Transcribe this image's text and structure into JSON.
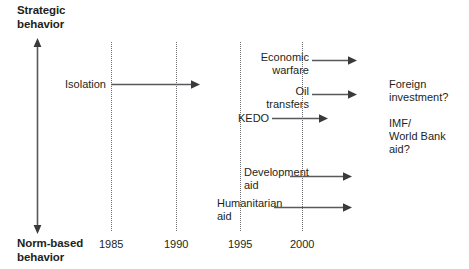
{
  "diagram": {
    "type": "timeline-axes",
    "y_axis": {
      "top_label": "Strategic\nbehavior",
      "bottom_label": "Norm-based\nbehavior",
      "arrow_style": "double-headed",
      "orientation": "vertical"
    },
    "x_axis": {
      "tick_labels": [
        "1985",
        "1990",
        "1995",
        "2000"
      ],
      "gridlines": "dotted-vertical"
    },
    "flows": [
      {
        "label": "Isolation",
        "label_align": "right",
        "arrow": "rightward",
        "start_tick": "1985",
        "end": "between 1990 and 1995"
      },
      {
        "label": "Economic\nwarfare",
        "label_align": "right",
        "arrow": "rightward",
        "start_tick": "2000",
        "end": "beyond 2000"
      },
      {
        "label": "Oil\ntransfers",
        "label_align": "right",
        "arrow": "rightward",
        "start_tick": "2000",
        "end": "beyond 2000"
      },
      {
        "label": "KEDO",
        "label_align": "left",
        "arrow": "rightward",
        "start_tick": "1995",
        "end": "beyond 2000"
      },
      {
        "label": "Development\naid",
        "label_align": "left",
        "arrow": "rightward",
        "start_tick": "1995",
        "end": "beyond 2000"
      },
      {
        "label": "Humanitarian\naid",
        "label_align": "left",
        "arrow": "rightward",
        "start_tick": "1995",
        "end": "beyond 2000"
      }
    ],
    "side_notes": [
      "Foreign\ninvestment?",
      "IMF/\nWorld Bank\naid?"
    ],
    "colors": {
      "text": "#231f20",
      "line": "#58595b",
      "gridline": "#6d6e71",
      "background": "#ffffff"
    }
  }
}
